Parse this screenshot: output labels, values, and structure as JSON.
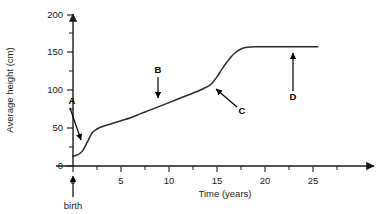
{
  "chart_data": {
    "type": "line",
    "title": "",
    "xlabel": "Time (years)",
    "ylabel": "Average height (cm)",
    "xlim": [
      -1,
      29
    ],
    "ylim": [
      0,
      210
    ],
    "xticks": [
      0,
      5,
      10,
      15,
      20,
      25
    ],
    "xtick_labels": [
      "0",
      "5",
      "10",
      "15",
      "20",
      "25"
    ],
    "x_minor_ticks": [
      2.5,
      7.5,
      12.5,
      17.5,
      22.5
    ],
    "yticks": [
      0,
      50,
      100,
      150,
      200
    ],
    "ytick_labels": [
      "0",
      "50",
      "100",
      "150",
      "200"
    ],
    "y_minor_ticks": [
      25,
      75,
      125,
      175
    ],
    "grid": false,
    "legend": "none",
    "series": [
      {
        "name": "Average height",
        "x": [
          0,
          0.5,
          1,
          1.5,
          2,
          2.5,
          3,
          4,
          5,
          6,
          7,
          8,
          9,
          10,
          11,
          12,
          13,
          14,
          14.5,
          15,
          15.5,
          16,
          16.5,
          17,
          17.5,
          18,
          19,
          20,
          21,
          22,
          23,
          24,
          25.5
        ],
        "values": [
          13,
          15,
          20,
          32,
          44,
          49,
          52,
          56,
          60,
          64,
          69,
          74,
          79,
          84,
          89,
          94,
          99,
          105,
          110,
          118,
          128,
          137,
          145,
          151,
          155,
          157,
          158,
          158,
          158,
          158,
          158,
          158,
          158
        ]
      }
    ],
    "annotations": [
      {
        "label": "A",
        "meaning": "infancy-rapid-growth",
        "label_x": 72,
        "label_y": 104,
        "arrow_from": [
          72,
          108
        ],
        "arrow_to": [
          82,
          141
        ]
      },
      {
        "label": "B",
        "meaning": "steady-childhood-growth",
        "label_x": 158,
        "label_y": 73,
        "arrow_from": [
          158,
          77
        ],
        "arrow_to": [
          158,
          99
        ]
      },
      {
        "label": "C",
        "meaning": "adolescent-growth-spurt",
        "label_x": 240,
        "label_y": 113,
        "arrow_from": [
          236,
          106
        ],
        "arrow_to": [
          215,
          88
        ]
      },
      {
        "label": "D",
        "meaning": "adult-plateau",
        "label_x": 293,
        "label_y": 99,
        "arrow_from": [
          293,
          90
        ],
        "arrow_to": [
          293,
          52
        ]
      },
      {
        "label": "birth",
        "meaning": "birth-marker",
        "label_x": 73,
        "label_y": 209,
        "arrow_from": [
          73,
          198
        ],
        "arrow_to": [
          73,
          176
        ]
      }
    ]
  }
}
